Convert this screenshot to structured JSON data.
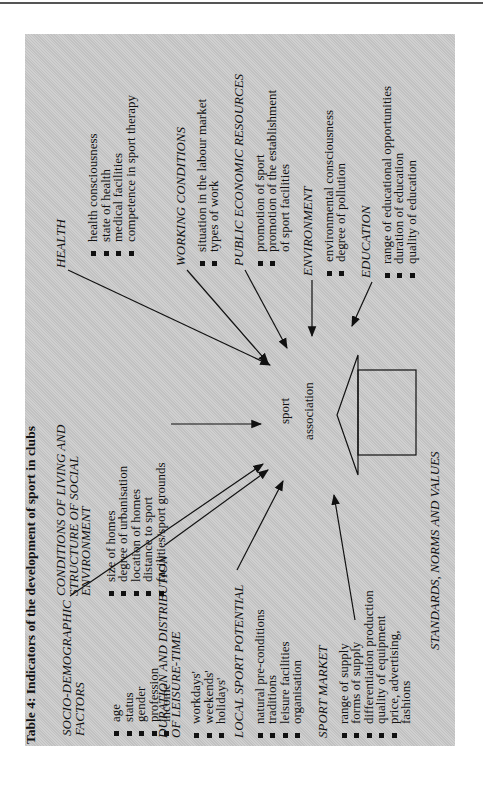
{
  "table_title": "Table 4: Indicators of the development of sport in clubs",
  "center": {
    "line1": "sport",
    "line2": "association"
  },
  "bottom_label": "STANDARDS, NORMS AND VALUES",
  "groups": {
    "socio_demographic": {
      "heading": [
        "SOCIO-DEMOGRAPHIC",
        "FACTORS"
      ],
      "items": [
        "age",
        "status",
        "gender",
        "profession",
        "income"
      ]
    },
    "conditions_of_living": {
      "heading": [
        "CONDITIONS OF LIVING AND",
        "STRUCTURE OF SOCIAL",
        "ENVIRONMENT"
      ],
      "items": [
        "size of homes",
        "degree of urbanisation",
        "location of homes",
        "distance to sport",
        "facilities/sport grounds"
      ]
    },
    "health": {
      "heading": [
        "HEALTH"
      ],
      "items": [
        "health consciousness",
        "state of health",
        "medical facilities",
        "competence in sport therapy"
      ]
    },
    "working_conditions": {
      "heading": [
        "WORKING CONDITIONS"
      ],
      "items": [
        "situation in the labour market",
        "types of work"
      ]
    },
    "public_economic_resources": {
      "heading": [
        "PUBLIC ECONOMIC RESOURCES"
      ],
      "items": [
        "promotion of sport",
        "promotion of the establishment",
        "of sport facilities"
      ]
    },
    "environment": {
      "heading": [
        "ENVIRONMENT"
      ],
      "items": [
        "environmental consciousness",
        "degree of pollution"
      ]
    },
    "education": {
      "heading": [
        "EDUCATION"
      ],
      "items": [
        "range of educational opportunities",
        "duration of education",
        "quality of education"
      ]
    },
    "leisure_time": {
      "heading": [
        "DURATION AND DISTRIBUTION",
        "OF LEISURE-TIME"
      ],
      "items": [
        "workdays'",
        "weekends'",
        "holidays'"
      ]
    },
    "local_sport_potential": {
      "heading": [
        "LOCAL SPORT POTENTIAL"
      ],
      "items": [
        "natural pre-conditions",
        "traditions",
        "leisure facilities",
        "organisation"
      ]
    },
    "sport_market": {
      "heading": [
        "SPORT MARKET"
      ],
      "items": [
        "range of supply",
        "forms of supply",
        "differentiation production",
        "quality of equipment",
        "price, advertising,",
        "fashions"
      ]
    }
  }
}
